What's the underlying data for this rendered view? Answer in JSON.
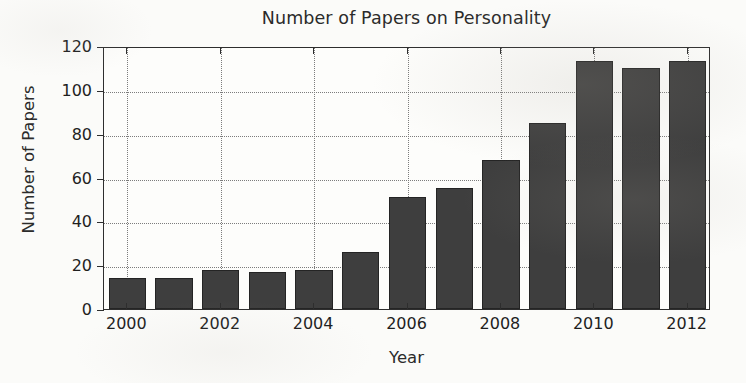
{
  "chart_data": {
    "type": "bar",
    "title": "Number of Papers on Personality",
    "xlabel": "Year",
    "ylabel": "Number of Papers",
    "categories": [
      "2000",
      "2001",
      "2002",
      "2003",
      "2004",
      "2005",
      "2006",
      "2007",
      "2008",
      "2009",
      "2010",
      "2011",
      "2012"
    ],
    "values": [
      14,
      14,
      18,
      17,
      18,
      26,
      51,
      55,
      68,
      85,
      113,
      110,
      113
    ],
    "xlim": [
      1999.5,
      2012.5
    ],
    "ylim": [
      0,
      120
    ],
    "ytick_labels": [
      "0",
      "20",
      "40",
      "60",
      "80",
      "100",
      "120"
    ],
    "ytick_values": [
      0,
      20,
      40,
      60,
      80,
      100,
      120
    ],
    "xtick_labels": [
      "2000",
      "2002",
      "2004",
      "2006",
      "2008",
      "2010",
      "2012"
    ],
    "xtick_values": [
      2000,
      2002,
      2004,
      2006,
      2008,
      2010,
      2012
    ],
    "grid": true,
    "grid_style": "dotted",
    "legend": null,
    "bar_color": "#3e3e3e",
    "bar_edge_color": "#242424",
    "background_color": "#fdfdfb",
    "axis_color": "#2e2e2e"
  }
}
